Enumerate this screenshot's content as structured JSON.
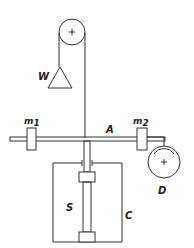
{
  "diagram": {
    "type": "torsion-balance apparatus",
    "labels": {
      "weight": "W",
      "mass1": "m",
      "mass1_sub": "1",
      "mass2": "m",
      "mass2_sub": "2",
      "rod": "A",
      "drum": "D",
      "spring": "S",
      "case": "C"
    },
    "colors": {
      "stroke": "#333333",
      "background": "#ffffff"
    }
  }
}
